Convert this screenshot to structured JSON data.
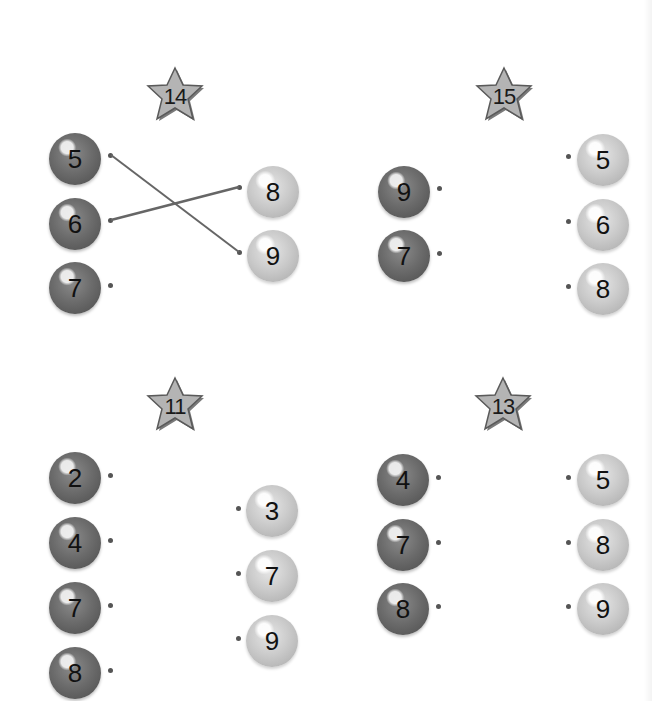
{
  "worksheet": {
    "puzzles": [
      {
        "target": "14",
        "left": [
          "5",
          "6",
          "7"
        ],
        "right": [
          "8",
          "9"
        ],
        "connections": [
          {
            "from": "5",
            "to": "9"
          },
          {
            "from": "6",
            "to": "8"
          }
        ]
      },
      {
        "target": "15",
        "left": [
          "9",
          "7"
        ],
        "right": [
          "5",
          "6",
          "8"
        ],
        "connections": []
      },
      {
        "target": "11",
        "left": [
          "2",
          "4",
          "7",
          "8"
        ],
        "right": [
          "3",
          "7",
          "9"
        ],
        "connections": []
      },
      {
        "target": "13",
        "left": [
          "4",
          "7",
          "8"
        ],
        "right": [
          "5",
          "8",
          "9"
        ],
        "connections": []
      }
    ],
    "colors": {
      "dark_ball": "#6c6c6c",
      "light_ball": "#c8c8c8",
      "star_fill": "#b4b4b4",
      "line": "#666666"
    }
  }
}
